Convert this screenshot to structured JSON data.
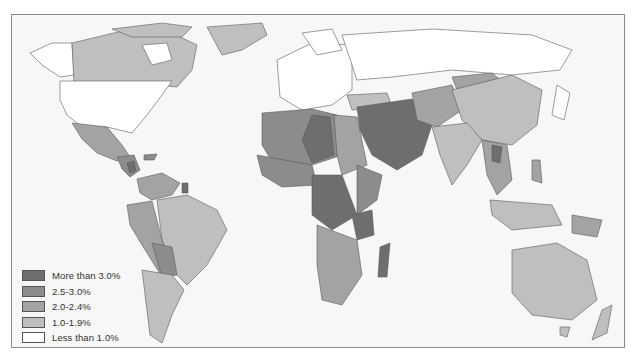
{
  "map": {
    "subject": "Population growth rate by country",
    "projection": "world, equirectangular-like",
    "colors": {
      "ocean": "#f7f7f7",
      "border": "#5a5a5a",
      "frame": "#8a8a8a"
    }
  },
  "legend": {
    "items": [
      {
        "label": "More than 3.0%",
        "color": "#6e6e6e"
      },
      {
        "label": "2.5-3.0%",
        "color": "#8c8c8c"
      },
      {
        "label": "2.0-2.4%",
        "color": "#a3a3a3"
      },
      {
        "label": "1.0-1.9%",
        "color": "#bfbfbf"
      },
      {
        "label": "Less than 1.0%",
        "color": "#ffffff"
      }
    ]
  },
  "regions": [
    {
      "name": "North America (USA)",
      "class": "Less than 1.0%"
    },
    {
      "name": "Canada",
      "class": "1.0-1.9%"
    },
    {
      "name": "Alaska",
      "class": "Less than 1.0%"
    },
    {
      "name": "Greenland",
      "class": "1.0-1.9%"
    },
    {
      "name": "Mexico",
      "class": "2.0-2.4%"
    },
    {
      "name": "Central America",
      "class": "2.5-3.0%"
    },
    {
      "name": "South America (Brazil, Argentina)",
      "class": "1.0-1.9%"
    },
    {
      "name": "Andean South America",
      "class": "2.0-2.4%"
    },
    {
      "name": "Europe",
      "class": "Less than 1.0%"
    },
    {
      "name": "Russia",
      "class": "Less than 1.0%"
    },
    {
      "name": "North Africa / Sahel",
      "class": "2.5-3.0%"
    },
    {
      "name": "Libya, Niger, Central Africa",
      "class": "More than 3.0%"
    },
    {
      "name": "Southern Africa",
      "class": "2.0-2.4%"
    },
    {
      "name": "Madagascar",
      "class": "More than 3.0%"
    },
    {
      "name": "Arabian Peninsula & Iran",
      "class": "More than 3.0%"
    },
    {
      "name": "Central Asia",
      "class": "2.0-2.4%"
    },
    {
      "name": "Mongolia",
      "class": "2.0-2.4%"
    },
    {
      "name": "China",
      "class": "1.0-1.9%"
    },
    {
      "name": "India",
      "class": "1.0-1.9%"
    },
    {
      "name": "Japan",
      "class": "Less than 1.0%"
    },
    {
      "name": "Southeast Asia",
      "class": "2.0-2.4%"
    },
    {
      "name": "Indonesia",
      "class": "1.0-1.9%"
    },
    {
      "name": "Australia",
      "class": "1.0-1.9%"
    },
    {
      "name": "New Zealand",
      "class": "1.0-1.9%"
    }
  ]
}
